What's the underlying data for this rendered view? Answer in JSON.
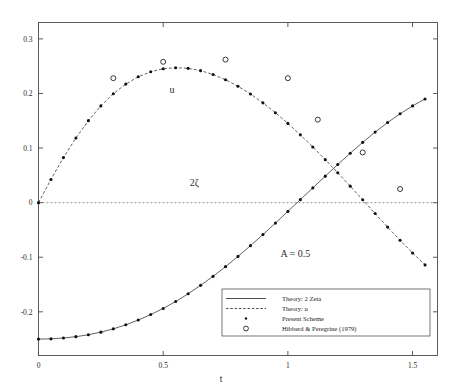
{
  "chart_data": {
    "type": "line",
    "title": "",
    "xlabel": "t",
    "ylabel": "",
    "xlim": [
      0,
      1.6
    ],
    "ylim": [
      -0.28,
      0.33
    ],
    "grid": false,
    "legend_position": "bottom-right",
    "x_ticks": [
      "0",
      "0.5",
      "1",
      "1.5"
    ],
    "x_tick_values": [
      0,
      0.5,
      1,
      1.5
    ],
    "y_ticks": [
      "0.3",
      "0.2",
      "0.1",
      "0",
      "-0.1",
      "-0.2"
    ],
    "y_tick_values": [
      0.3,
      0.2,
      0.1,
      0,
      -0.1,
      -0.2
    ],
    "annotations": [
      {
        "text": "A = 0.5",
        "x": 1.03,
        "y": -0.1
      },
      {
        "text": "u",
        "x": 0.535,
        "y": 0.2
      },
      {
        "text": "2ζ",
        "x": 0.625,
        "y": 0.03
      }
    ],
    "zero_line": 0,
    "series": [
      {
        "name": "Theory: 2 Zeta",
        "style": "solid",
        "x": [
          0,
          0.05,
          0.1,
          0.15,
          0.2,
          0.25,
          0.3,
          0.35,
          0.4,
          0.45,
          0.5,
          0.55,
          0.6,
          0.65,
          0.7,
          0.75,
          0.8,
          0.85,
          0.9,
          0.95,
          1.0,
          1.05,
          1.1,
          1.15,
          1.2,
          1.25,
          1.3,
          1.35,
          1.4,
          1.45,
          1.5,
          1.55
        ],
        "values": [
          -0.25,
          -0.2495,
          -0.248,
          -0.2455,
          -0.242,
          -0.2372,
          -0.2312,
          -0.2238,
          -0.215,
          -0.205,
          -0.1938,
          -0.1812,
          -0.167,
          -0.1515,
          -0.135,
          -0.1172,
          -0.0985,
          -0.0788,
          -0.0585,
          -0.0375,
          -0.016,
          0.0055,
          0.027,
          0.0485,
          0.0698,
          0.0905,
          0.1105,
          0.1292,
          0.1468,
          0.1628,
          0.1772,
          0.19
        ]
      },
      {
        "name": "Theory: u",
        "style": "dashed",
        "x": [
          0,
          0.05,
          0.1,
          0.15,
          0.2,
          0.25,
          0.3,
          0.35,
          0.4,
          0.45,
          0.5,
          0.55,
          0.6,
          0.65,
          0.7,
          0.75,
          0.8,
          0.85,
          0.9,
          0.95,
          1.0,
          1.05,
          1.1,
          1.15,
          1.2,
          1.25,
          1.3,
          1.35,
          1.4,
          1.45,
          1.5,
          1.55
        ],
        "values": [
          0,
          0.0425,
          0.0825,
          0.1185,
          0.1502,
          0.1772,
          0.1995,
          0.2172,
          0.2305,
          0.2398,
          0.2452,
          0.2472,
          0.246,
          0.2418,
          0.2348,
          0.2252,
          0.2132,
          0.199,
          0.1828,
          0.1648,
          0.1452,
          0.1242,
          0.102,
          0.0788,
          0.0548,
          0.0302,
          0.0052,
          -0.02,
          -0.0448,
          -0.069,
          -0.0922,
          -0.114
        ]
      },
      {
        "name": "Present Scheme (2 Zeta)",
        "style": "dots",
        "x": [
          0,
          0.05,
          0.1,
          0.15,
          0.2,
          0.25,
          0.3,
          0.35,
          0.4,
          0.45,
          0.5,
          0.55,
          0.6,
          0.65,
          0.7,
          0.75,
          0.8,
          0.85,
          0.9,
          0.95,
          1.0,
          1.05,
          1.1,
          1.15,
          1.2,
          1.25,
          1.3,
          1.35,
          1.4,
          1.45,
          1.5,
          1.55
        ],
        "values": [
          -0.25,
          -0.2495,
          -0.248,
          -0.2455,
          -0.242,
          -0.2372,
          -0.2312,
          -0.2238,
          -0.215,
          -0.205,
          -0.1938,
          -0.1812,
          -0.167,
          -0.1515,
          -0.135,
          -0.1172,
          -0.0985,
          -0.0788,
          -0.0585,
          -0.0375,
          -0.016,
          0.0055,
          0.027,
          0.0485,
          0.0698,
          0.0905,
          0.1105,
          0.1292,
          0.1468,
          0.1628,
          0.1772,
          0.19
        ]
      },
      {
        "name": "Present Scheme (u)",
        "style": "dots",
        "x": [
          0,
          0.05,
          0.1,
          0.15,
          0.2,
          0.25,
          0.3,
          0.35,
          0.4,
          0.45,
          0.5,
          0.55,
          0.6,
          0.65,
          0.7,
          0.75,
          0.8,
          0.85,
          0.9,
          0.95,
          1.0,
          1.05,
          1.1,
          1.15,
          1.2,
          1.25,
          1.3,
          1.35,
          1.4,
          1.45,
          1.5,
          1.55
        ],
        "values": [
          0,
          0.0425,
          0.0825,
          0.1185,
          0.1502,
          0.1772,
          0.1995,
          0.2172,
          0.2305,
          0.2398,
          0.2452,
          0.2472,
          0.246,
          0.2418,
          0.2348,
          0.2252,
          0.2132,
          0.199,
          0.1828,
          0.1648,
          0.1452,
          0.1242,
          0.102,
          0.0788,
          0.0548,
          0.0302,
          0.0052,
          -0.02,
          -0.0448,
          -0.069,
          -0.0922,
          -0.114
        ]
      },
      {
        "name": "Hibberd & Peregrine (1979) u",
        "style": "circles",
        "x": [
          0.3,
          0.5,
          0.75,
          1.0,
          1.12,
          1.3,
          1.45
        ],
        "values": [
          0.228,
          0.258,
          0.262,
          0.228,
          0.152,
          0.092,
          0.025
        ]
      }
    ],
    "legend": [
      {
        "label": "Theory: 2 Zeta",
        "sample": "solid-line"
      },
      {
        "label": "Theory: u",
        "sample": "dashed-line"
      },
      {
        "label": "Present Scheme",
        "sample": "dot"
      },
      {
        "label": "Hibberd & Peregrine (1979)",
        "sample": "open-circle"
      }
    ]
  }
}
